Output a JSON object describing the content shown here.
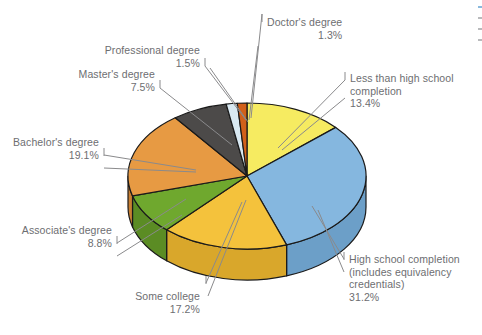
{
  "chart_data": {
    "type": "pie",
    "title": "",
    "subtitle": "",
    "xlabel": "",
    "ylabel": "",
    "legend_position": "callout-labels",
    "grid": false,
    "units": "percent",
    "total": 100.0,
    "categories": [
      "Less than high school completion",
      "High school completion (includes equivalency credentials)",
      "Some college",
      "Associate's degree",
      "Bachelor's degree",
      "Master's degree",
      "Professional degree",
      "Doctor's degree"
    ],
    "values": [
      13.4,
      31.2,
      17.2,
      8.8,
      19.1,
      7.5,
      1.5,
      1.3
    ],
    "slices": [
      {
        "id": "less-than-high-school",
        "label_lines": [
          "Less than high school",
          "completion"
        ],
        "percent_text": "13.4%",
        "value": 13.4,
        "color": "#F6EB61",
        "side_color": "#D8CE4B"
      },
      {
        "id": "high-school-completion",
        "label_lines": [
          "High school completion",
          "(includes equivalency",
          "credentials)"
        ],
        "percent_text": "31.2%",
        "value": 31.2,
        "color": "#85B7DF",
        "side_color": "#6C9FC8"
      },
      {
        "id": "some-college",
        "label_lines": [
          "Some college"
        ],
        "percent_text": "17.2%",
        "value": 17.2,
        "color": "#F4C23C",
        "side_color": "#D9A72B"
      },
      {
        "id": "associates-degree",
        "label_lines": [
          "Associate's degree"
        ],
        "percent_text": "8.8%",
        "value": 8.8,
        "color": "#6FA82E",
        "side_color": "#5B8C24"
      },
      {
        "id": "bachelors-degree",
        "label_lines": [
          "Bachelor's degree"
        ],
        "percent_text": "19.1%",
        "value": 19.1,
        "color": "#E79A43",
        "side_color": "#C87F32"
      },
      {
        "id": "masters-degree",
        "label_lines": [
          "Master's degree"
        ],
        "percent_text": "7.5%",
        "value": 7.5,
        "color": "#4C4A49",
        "side_color": "#353433"
      },
      {
        "id": "professional-degree",
        "label_lines": [
          "Professional degree"
        ],
        "percent_text": "1.5%",
        "value": 1.5,
        "color": "#D9E9F2",
        "side_color": "#B9D2E0"
      },
      {
        "id": "doctors-degree",
        "label_lines": [
          "Doctor's degree"
        ],
        "percent_text": "1.3%",
        "value": 1.3,
        "color": "#D2601A",
        "side_color": "#B04E12"
      }
    ]
  },
  "labels": {
    "doctors": {
      "name": "Doctor's degree",
      "pct": "1.3%"
    },
    "professional": {
      "name": "Professional degree",
      "pct": "1.5%"
    },
    "masters": {
      "name": "Master's degree",
      "pct": "7.5%"
    },
    "bachelors": {
      "name": "Bachelor's degree",
      "pct": "19.1%"
    },
    "associates": {
      "name": "Associate's degree",
      "pct": "8.8%"
    },
    "some_college": {
      "name": "Some college",
      "pct": "17.2%"
    },
    "high_school": {
      "line1": "High school completion",
      "line2": "(includes equivalency",
      "line3": "credentials)",
      "pct": "31.2%"
    },
    "less_than_hs": {
      "line1": "Less than high school",
      "line2": "completion",
      "pct": "13.4%"
    }
  },
  "colors": {
    "outline": "#1a1a1a",
    "leader": "#8a8a8c",
    "text": "#6d6e71",
    "background": "#ffffff"
  }
}
